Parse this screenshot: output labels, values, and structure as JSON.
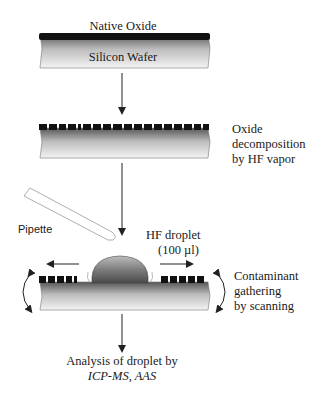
{
  "steps": [
    {
      "id": "initial",
      "labels": {
        "top": "Native Oxide",
        "inner": "Silicon Wafer"
      }
    },
    {
      "id": "decomposition",
      "description": [
        "Oxide",
        "decomposition",
        "by HF vapor"
      ]
    },
    {
      "id": "scanning",
      "pipette_label": "Pipette",
      "droplet_label": [
        "HF droplet",
        "(100 µl)"
      ],
      "description": [
        "Contaminant",
        "gathering",
        "by scanning"
      ]
    },
    {
      "id": "analysis",
      "description": [
        "Analysis of droplet by",
        "ICP-MS, AAS"
      ]
    }
  ],
  "colors": {
    "oxide": "#111111",
    "wafer_top": "#6a6a6a",
    "wafer_bottom": "#f2f2f2",
    "line": "#222222"
  }
}
